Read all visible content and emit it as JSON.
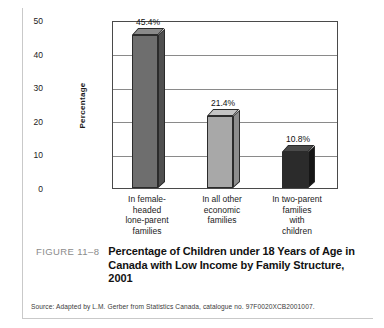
{
  "chart_data": {
    "type": "bar",
    "title": "",
    "xlabel": "",
    "ylabel": "Percentage",
    "ylim": [
      0,
      50
    ],
    "yticks": [
      0,
      10,
      20,
      30,
      40,
      50
    ],
    "grid": true,
    "legend": "none",
    "categories": [
      "In female-\nheaded\nlone-parent\nfamilies",
      "In all other\neconomic\nfamilies",
      "In two-parent\nfamilies\nwith\nchildren"
    ],
    "category_lines": [
      [
        "In female-",
        "headed",
        "lone-parent",
        "families"
      ],
      [
        "In all other",
        "economic",
        "families"
      ],
      [
        "In two-parent",
        "families",
        "with",
        "children"
      ]
    ],
    "values": [
      45.4,
      21.4,
      10.8
    ],
    "data_labels": [
      "45.4%",
      "21.4%",
      "10.8%"
    ],
    "bar_colors": [
      "#6e6e6e",
      "#a8a8a8",
      "#2b2b2b"
    ],
    "bar_top_colors": [
      "#8a8a8a",
      "#c4c4c4",
      "#4a4a4a"
    ],
    "bar_side_colors": [
      "#4f4f4f",
      "#8d8d8d",
      "#161616"
    ],
    "axis_color": "#4a4a4a",
    "grid_color": "#8a8a8a"
  },
  "caption": {
    "figure_number": "FIGURE 11–8",
    "title": "Percentage of Children under 18 Years of Age in Canada with Low Income by Family Structure, 2001"
  },
  "source": {
    "text": "Source: Adapted by L.M. Gerber from Statistics Canada, catalogue no. 97F0020XCB2001007."
  }
}
